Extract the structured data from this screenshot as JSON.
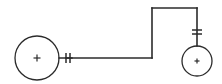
{
  "diagram": {
    "background_color": "#ffffff",
    "line_color": "#2b2b2b",
    "canvas": {
      "width": 222,
      "height": 84
    },
    "nodes": [
      {
        "id": "left-node",
        "label": "+",
        "shape": "circle",
        "cx": 37,
        "cy": 58,
        "r": 22,
        "plus_size": 7
      },
      {
        "id": "right-node",
        "label": "+",
        "shape": "circle",
        "cx": 197,
        "cy": 61,
        "r": 15,
        "plus_size": 5
      }
    ],
    "wire": {
      "path": "M 66 58 L 152 58 L 152 8 L 197 8 L 197 46",
      "segments": [
        {
          "name": "lower-horizontal-wire",
          "x1": 66,
          "y1": 58,
          "x2": 152,
          "y2": 58
        },
        {
          "name": "vertical-riser-wire",
          "x1": 152,
          "y1": 58,
          "x2": 152,
          "y2": 8
        },
        {
          "name": "upper-horizontal-wire",
          "x1": 152,
          "y1": 8,
          "x2": 197,
          "y2": 8
        },
        {
          "name": "right-drop-wire",
          "x1": 197,
          "y1": 8,
          "x2": 197,
          "y2": 46
        }
      ]
    },
    "left_stub": {
      "x1": 59,
      "y1": 58,
      "x2": 72,
      "y2": 58
    },
    "tick_marks": [
      {
        "name": "left-tick-1",
        "orientation": "vertical",
        "x1": 66,
        "y1": 53,
        "x2": 66,
        "y2": 63
      },
      {
        "name": "left-tick-2",
        "orientation": "vertical",
        "x1": 70,
        "y1": 53,
        "x2": 70,
        "y2": 63
      },
      {
        "name": "right-tick-1",
        "orientation": "horizontal",
        "x1": 192,
        "y1": 30,
        "x2": 202,
        "y2": 30
      },
      {
        "name": "right-tick-2",
        "orientation": "horizontal",
        "x1": 192,
        "y1": 34,
        "x2": 202,
        "y2": 34
      }
    ]
  }
}
